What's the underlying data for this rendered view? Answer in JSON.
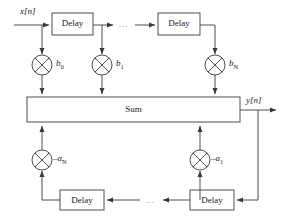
{
  "diagram": {
    "type": "signal-flow-block-diagram",
    "colors": {
      "line": "#3a3a3a",
      "text": "#1a1a1a",
      "background": "#ffffff"
    },
    "signals": {
      "input_label": "x[n]",
      "output_label": "y[n]"
    },
    "sum_block": {
      "label": "Sum"
    },
    "feedforward": {
      "delay_blocks": [
        {
          "label": "Delay",
          "id": "ff-delay-1"
        },
        {
          "label": "Delay",
          "id": "ff-delay-2"
        }
      ],
      "ellipsis": "...",
      "multipliers": [
        {
          "id": "mult-b0",
          "symbol": "⊗",
          "coefficient": "b",
          "subscript": "0"
        },
        {
          "id": "mult-b1",
          "symbol": "⊗",
          "coefficient": "b",
          "subscript": "1"
        },
        {
          "id": "mult-bN",
          "symbol": "⊗",
          "coefficient": "b",
          "subscript": "N"
        }
      ]
    },
    "feedback": {
      "delay_blocks": [
        {
          "label": "Delay",
          "id": "fb-delay-1"
        },
        {
          "label": "Delay",
          "id": "fb-delay-2"
        }
      ],
      "ellipsis": "...",
      "multipliers": [
        {
          "id": "mult-aN",
          "symbol": "⊗",
          "coefficient": "–a",
          "subscript": "N"
        },
        {
          "id": "mult-a1",
          "symbol": "⊗",
          "coefficient": "–a",
          "subscript": "1"
        }
      ]
    }
  }
}
